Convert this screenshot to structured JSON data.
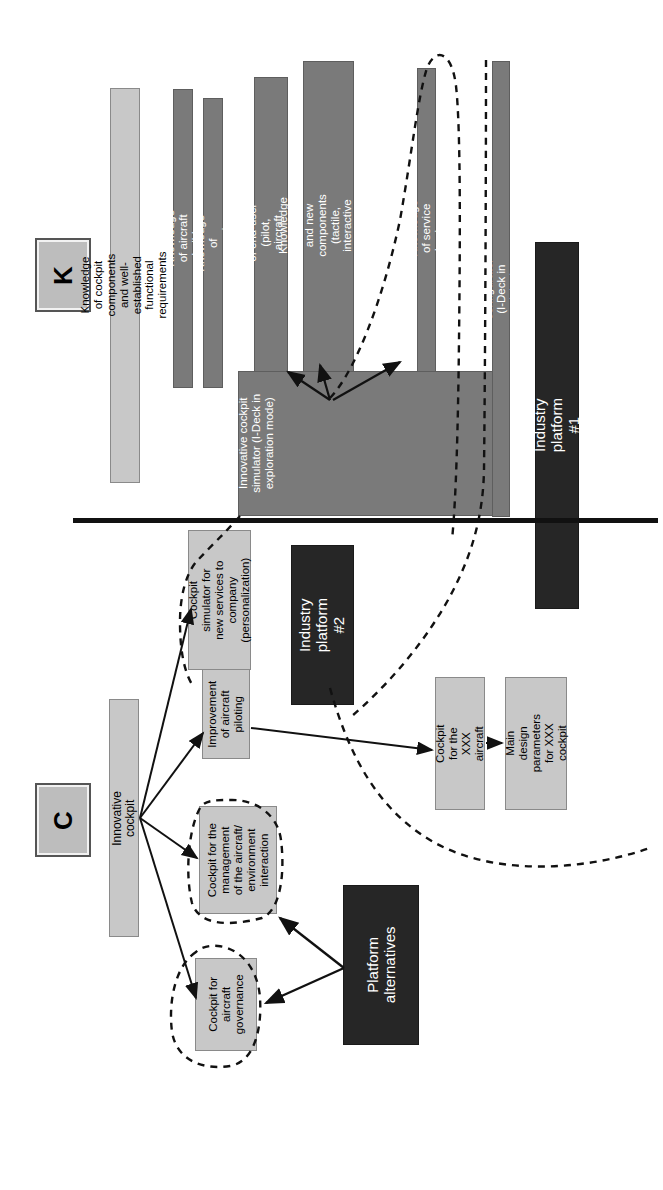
{
  "diagram": {
    "orientation": "rotated-90-ccw",
    "legend": {
      "k_badge": "K",
      "c_badge": "C"
    },
    "colors": {
      "light_fill": "#c8c8c8",
      "mid_fill": "#7a7a7a",
      "dark_fill": "#262626",
      "line": "#111111",
      "white_text": "#ffffff",
      "black_text": "#000000"
    },
    "k_space": {
      "label": "K",
      "nodes": [
        {
          "id": "k-cockpit-components",
          "text": "Knowledge of cockpit components and well-established functional requirements",
          "style": "light"
        },
        {
          "id": "k-aircraft-builder",
          "text": "Knowledge of aircraft builder",
          "style": "mid"
        },
        {
          "id": "k-companies",
          "text": "Knowledge of companies",
          "style": "mid"
        },
        {
          "id": "k-end-user",
          "text": "Knowledge of end-user (pilot, aircraft passangers, etc.)",
          "style": "mid"
        },
        {
          "id": "k-traditional-new-components",
          "text": "Knowledge of traditional and new components (tactile, interactive interface, etc.)",
          "style": "mid"
        },
        {
          "id": "k-service-business",
          "text": "Knowledge of service business",
          "style": "mid"
        },
        {
          "id": "k-cockpit-configurator",
          "text": "Cockpit configurator (I-Deck in exploitation mode)",
          "style": "mid"
        },
        {
          "id": "k-innovative-cockpit-simulator",
          "text": "Innovative cockpit simulator (I-Deck in exploration mode)",
          "style": "mid"
        },
        {
          "id": "k-industry-platform-1",
          "text": "Industry platform #1",
          "style": "dark"
        }
      ]
    },
    "c_space": {
      "label": "C",
      "nodes": [
        {
          "id": "c-innovative-cockpit",
          "text": "Innovative cockpit",
          "style": "light"
        },
        {
          "id": "c-cockpit-simulator-new-services",
          "text": "Cockpit simulator for new services to company (personalization)",
          "style": "light"
        },
        {
          "id": "c-improvement-aircraft-piloting",
          "text": "Improvement of aircraft piloting",
          "style": "light"
        },
        {
          "id": "c-cockpit-management-interaction",
          "text": "Cockpit for the management of the aircraft/ environment interaction",
          "style": "light"
        },
        {
          "id": "c-cockpit-aircraft-governance",
          "text": "Cockpit for aircraft governance",
          "style": "light"
        },
        {
          "id": "c-cockpit-xxx-aircraft",
          "text": "Cockpit for the XXX aircraft",
          "style": "light"
        },
        {
          "id": "c-main-design-parameters",
          "text": "Main design parameters for XXX cockpit",
          "style": "light"
        },
        {
          "id": "c-industry-platform-2",
          "text": "Industry platform #2",
          "style": "dark"
        },
        {
          "id": "c-platform-alternatives",
          "text": "Platform alternatives",
          "style": "dark"
        }
      ]
    }
  }
}
